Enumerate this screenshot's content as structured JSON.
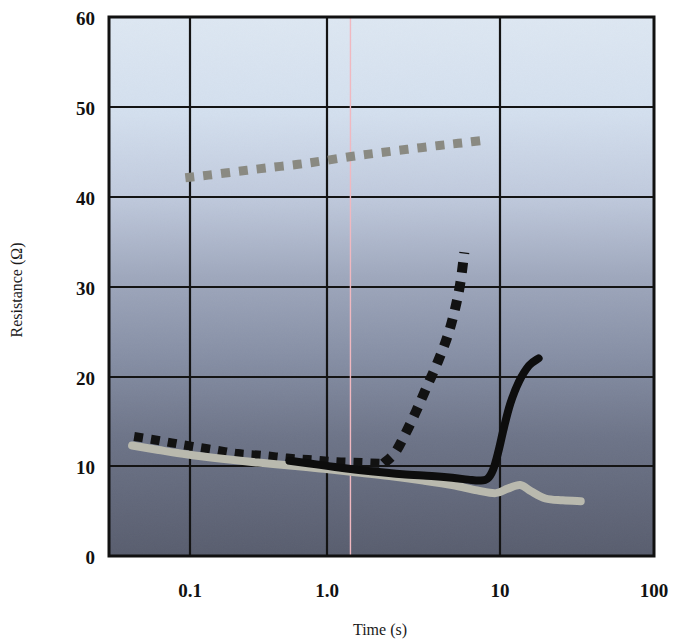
{
  "chart_data": {
    "type": "line",
    "title": "",
    "xlabel": "Time (s)",
    "ylabel": "Resistance (Ω)",
    "xscale": "log",
    "yscale": "linear",
    "xlim": [
      0.05,
      100
    ],
    "ylim": [
      0,
      60
    ],
    "xticks": [
      "0.1",
      "1.0",
      "10",
      "100"
    ],
    "xtick_values": [
      0.1,
      1.0,
      10,
      100
    ],
    "yticks": [
      "0",
      "10",
      "20",
      "30",
      "40",
      "50",
      "60"
    ],
    "ytick_values": [
      0,
      10,
      20,
      30,
      40,
      50,
      60
    ],
    "grid": true,
    "legend": "none",
    "background": "vertical gradient light blue to dark slate",
    "series": [
      {
        "name": "gray-dashed-upper",
        "style": "dashed",
        "color": "#8a8a82",
        "points": [
          [
            0.145,
            42.1
          ],
          [
            0.2,
            42.4
          ],
          [
            0.3,
            42.8
          ],
          [
            0.45,
            43.2
          ],
          [
            0.7,
            43.6
          ],
          [
            1.0,
            44.0
          ],
          [
            1.5,
            44.5
          ],
          [
            2.2,
            44.9
          ],
          [
            3.3,
            45.3
          ],
          [
            5.0,
            45.7
          ],
          [
            7.0,
            46.0
          ],
          [
            9.6,
            46.3
          ]
        ]
      },
      {
        "name": "black-dashed-lower-declining",
        "style": "dashed",
        "color": "#121212",
        "points": [
          [
            0.071,
            13.3
          ],
          [
            0.09,
            13.0
          ],
          [
            0.12,
            12.6
          ],
          [
            0.16,
            12.2
          ],
          [
            0.22,
            11.8
          ],
          [
            0.3,
            11.4
          ],
          [
            0.42,
            11.2
          ],
          [
            0.6,
            10.9
          ],
          [
            0.85,
            10.7
          ],
          [
            1.2,
            10.5
          ],
          [
            1.7,
            10.4
          ],
          [
            2.3,
            10.3
          ]
        ]
      },
      {
        "name": "black-dashed-rising",
        "style": "dashed",
        "color": "#121212",
        "points": [
          [
            2.3,
            10.3
          ],
          [
            2.7,
            11.5
          ],
          [
            3.1,
            13.5
          ],
          [
            3.6,
            16.0
          ],
          [
            4.2,
            18.8
          ],
          [
            4.9,
            21.6
          ],
          [
            5.6,
            24.4
          ],
          [
            6.2,
            27.3
          ],
          [
            6.7,
            30.3
          ],
          [
            7.1,
            33.8
          ]
        ]
      },
      {
        "name": "gray-solid",
        "style": "solid",
        "color": "#b9b9ae",
        "points": [
          [
            0.069,
            12.3
          ],
          [
            0.1,
            11.8
          ],
          [
            0.15,
            11.3
          ],
          [
            0.25,
            10.8
          ],
          [
            0.4,
            10.4
          ],
          [
            0.7,
            10.0
          ],
          [
            1.0,
            9.7
          ],
          [
            1.6,
            9.3
          ],
          [
            2.5,
            8.9
          ],
          [
            4.0,
            8.4
          ],
          [
            6.0,
            7.9
          ],
          [
            8.5,
            7.3
          ],
          [
            11.0,
            7.0
          ],
          [
            13.0,
            7.5
          ],
          [
            15.5,
            7.9
          ],
          [
            18.0,
            7.2
          ],
          [
            22.0,
            6.4
          ],
          [
            28.0,
            6.2
          ],
          [
            36.0,
            6.1
          ]
        ]
      },
      {
        "name": "black-solid",
        "style": "solid",
        "color": "#0d0d0d",
        "points": [
          [
            0.62,
            10.6
          ],
          [
            0.9,
            10.2
          ],
          [
            1.3,
            9.8
          ],
          [
            2.0,
            9.4
          ],
          [
            3.0,
            9.1
          ],
          [
            4.5,
            8.9
          ],
          [
            6.0,
            8.7
          ],
          [
            7.5,
            8.5
          ],
          [
            8.8,
            8.4
          ],
          [
            9.8,
            8.6
          ],
          [
            10.6,
            9.6
          ],
          [
            11.4,
            11.6
          ],
          [
            12.3,
            14.2
          ],
          [
            13.5,
            17.0
          ],
          [
            15.2,
            19.4
          ],
          [
            17.5,
            21.2
          ],
          [
            20.0,
            22.0
          ]
        ]
      }
    ],
    "marker_line": {
      "name": "vertical-cursor",
      "x": 1.45,
      "color": "#f0b8c0"
    }
  },
  "figure": {
    "caption": "",
    "plot_border_color": "#111111"
  }
}
